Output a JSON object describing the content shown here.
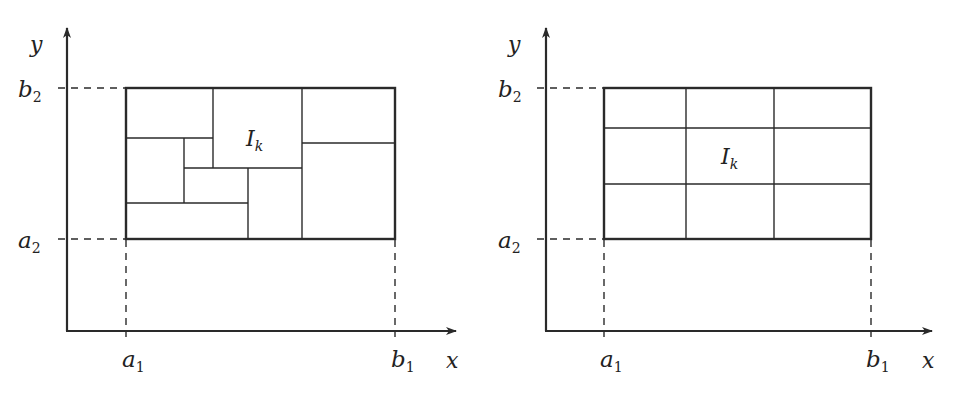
{
  "diagrams": [
    {
      "name": "irregular-partition",
      "labels": {
        "y_axis": "y",
        "x_axis": "x",
        "b2": "b",
        "b2_sub": "2",
        "a2": "a",
        "a2_sub": "2",
        "a1": "a",
        "a1_sub": "1",
        "b1": "b",
        "b1_sub": "1",
        "cell": "I",
        "cell_sub": "k"
      }
    },
    {
      "name": "regular-grid-partition",
      "labels": {
        "y_axis": "y",
        "x_axis": "x",
        "b2": "b",
        "b2_sub": "2",
        "a2": "a",
        "a2_sub": "2",
        "a1": "a",
        "a1_sub": "1",
        "b1": "b",
        "b1_sub": "1",
        "cell": "I",
        "cell_sub": "k"
      },
      "grid": {
        "columns": 3,
        "rows": 3
      }
    }
  ],
  "colors": {
    "ink": "#2a2a2a",
    "background": "#ffffff"
  }
}
